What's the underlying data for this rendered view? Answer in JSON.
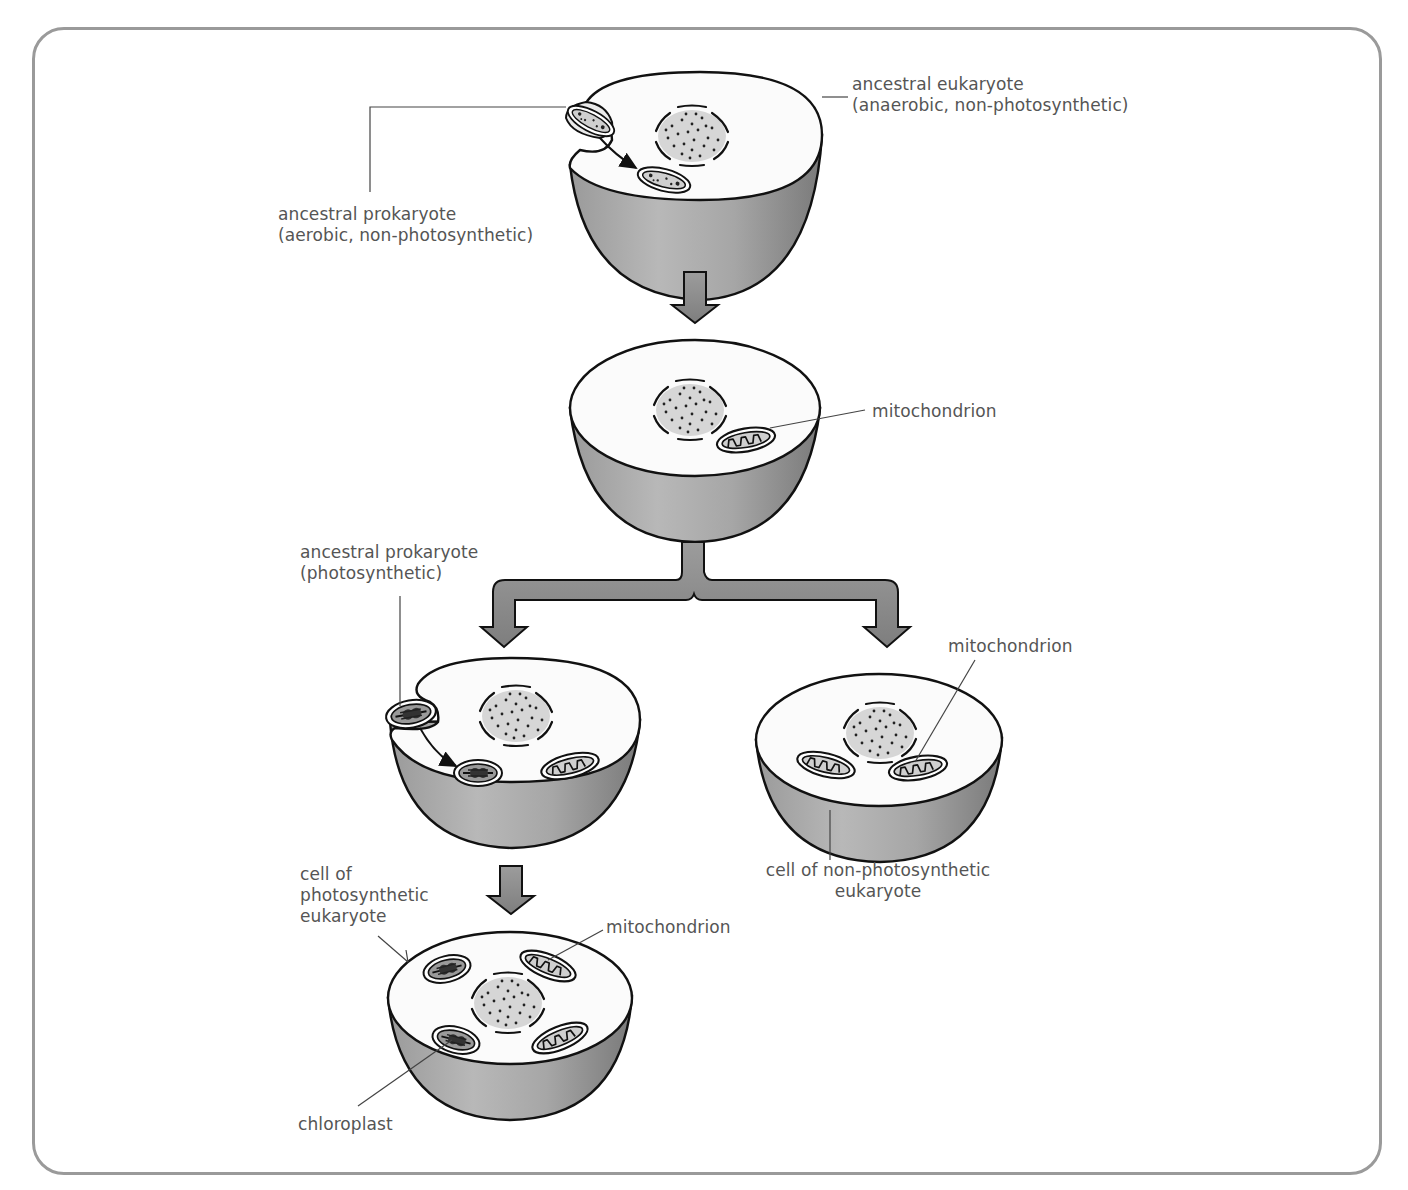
{
  "colors": {
    "frame": "#9a9a9a",
    "label_text": "#555555",
    "cell_top": "#fbfbfb",
    "cell_shade_dark": "#7e7e7e",
    "cell_shade_light": "#c4c4c4",
    "outline": "#1a1a1a",
    "arrow_fill": "#8c8c8c",
    "nucleus_fill": "#d6d6d6"
  },
  "labels": {
    "ancestral_eukaryote": {
      "line1": "ancestral eukaryote",
      "line2": "(anaerobic, non-photosynthetic)"
    },
    "ancestral_prokaryote_aerobic": {
      "line1": "ancestral prokaryote",
      "line2": "(aerobic, non-photosynthetic)"
    },
    "mitochondrion_stage2": "mitochondrion",
    "ancestral_prokaryote_photosynthetic": {
      "line1": "ancestral prokaryote",
      "line2": "(photosynthetic)"
    },
    "mitochondrion_nonphoto": "mitochondrion",
    "cell_nonphoto": {
      "line1": "cell of non-photosynthetic",
      "line2": "eukaryote"
    },
    "cell_photo": {
      "line1": "cell of",
      "line2": "photosynthetic",
      "line3": "eukaryote"
    },
    "mitochondrion_photo": "mitochondrion",
    "chloroplast": "chloroplast"
  },
  "stages": [
    {
      "id": "stage-1",
      "description": "Ancestral anaerobic eukaryote engulfs aerobic prokaryote"
    },
    {
      "id": "stage-2",
      "description": "Eukaryote with mitochondrion"
    },
    {
      "id": "stage-3a",
      "description": "Eukaryote engulfs photosynthetic prokaryote"
    },
    {
      "id": "stage-3b",
      "description": "Non-photosynthetic eukaryote with mitochondria"
    },
    {
      "id": "stage-4",
      "description": "Photosynthetic eukaryote with mitochondria and chloroplasts"
    }
  ]
}
